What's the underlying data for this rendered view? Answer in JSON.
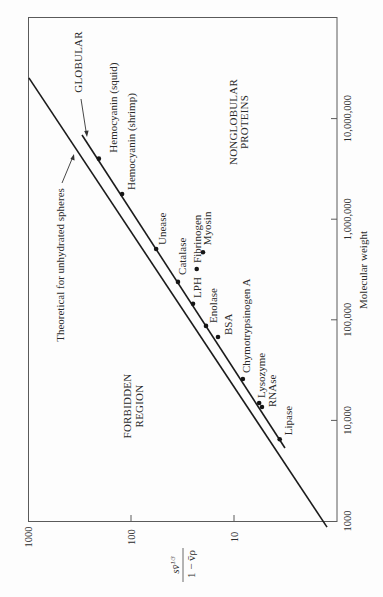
{
  "figure": {
    "region_labels": {
      "globular": "GLOBULAR",
      "nonglobular_line1": "NONGLOBULAR",
      "nonglobular_line2": "PROTEINS",
      "forbidden_line1": "FORBIDDEN",
      "forbidden_line2": "REGION",
      "theoretical": "Theoretical for unhydrated spheres"
    },
    "ylabel_parts": {
      "numerator": "sv̄",
      "numerator_sup": "1/3",
      "denominator": "1 − v̄ρ"
    }
  },
  "chart_data": {
    "type": "scatter",
    "title": "",
    "orientation": "rotated 90° counterclockwise (molecular weight increases upward, s-term increases leftward)",
    "xlabel": "Molecular weight",
    "ylabel": "s v̄^(1/3) / (1 − v̄ρ)",
    "x_scale": "log",
    "y_scale": "log",
    "xlim": [
      1000,
      100000000
    ],
    "ylim": [
      1,
      1000
    ],
    "x_ticks": [
      1000,
      10000,
      100000,
      1000000,
      10000000
    ],
    "x_tick_labels": [
      "1000",
      "10,000",
      "100,000",
      "1,000,000",
      "10,000,000"
    ],
    "y_ticks": [
      10,
      100,
      1000
    ],
    "y_tick_labels": [
      "10",
      "100",
      "1000"
    ],
    "grid": false,
    "legend": null,
    "points": [
      {
        "label": "Hemocyanin (squid)",
        "mw": 4000000,
        "s_term": 205
      },
      {
        "label": "Hemocyanin (shrimp)",
        "mw": 1780000,
        "s_term": 122
      },
      {
        "label": "Unease",
        "mw": 505000,
        "s_term": 57
      },
      {
        "label": "Catalase",
        "mw": 238000,
        "s_term": 35
      },
      {
        "label": "Fibrinogen",
        "mw": 320000,
        "s_term": 23
      },
      {
        "label": "Myosin",
        "mw": 470000,
        "s_term": 20
      },
      {
        "label": "LPH",
        "mw": 144000,
        "s_term": 25
      },
      {
        "label": "Enolase",
        "mw": 87000,
        "s_term": 18.7
      },
      {
        "label": "BSA",
        "mw": 67500,
        "s_term": 14.3
      },
      {
        "label": "Chymotrypsinogen A",
        "mw": 25800,
        "s_term": 8.2
      },
      {
        "label": "Lysozyme",
        "mw": 14900,
        "s_term": 5.7
      },
      {
        "label": "RNAse",
        "mw": 13600,
        "s_term": 5.35
      },
      {
        "label": "Lipase",
        "mw": 6500,
        "s_term": 3.6
      }
    ],
    "lines": [
      {
        "name": "Theoretical for unhydrated spheres",
        "points": [
          {
            "mw": 25400000,
            "s_term": 980
          },
          {
            "mw": 870,
            "s_term": 1.25
          }
        ]
      },
      {
        "name": "GLOBULAR",
        "points": [
          {
            "mw": 6870000,
            "s_term": 299
          },
          {
            "mw": 5320,
            "s_term": 3.2
          }
        ]
      }
    ],
    "annotations": [
      "GLOBULAR",
      "NONGLOBULAR PROTEINS",
      "FORBIDDEN REGION",
      "Theoretical for unhydrated spheres"
    ]
  }
}
